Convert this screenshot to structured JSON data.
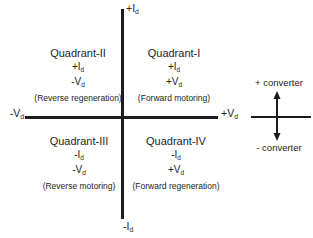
{
  "diagram": {
    "axes": {
      "top_label": {
        "main": "+I",
        "sub": "d"
      },
      "bottom_label": {
        "main": "-I",
        "sub": "d"
      },
      "left_label": {
        "main": "-V",
        "sub": "d"
      },
      "right_label": {
        "main": "+V",
        "sub": "d"
      }
    },
    "quadrants": {
      "q1": {
        "title": "Quadrant-I",
        "current": {
          "main": "+I",
          "sub": "d"
        },
        "voltage": {
          "main": "+V",
          "sub": "d"
        },
        "caption": "(Forward motoring)"
      },
      "q2": {
        "title": "Quadrant-II",
        "current": {
          "main": "+I",
          "sub": "d"
        },
        "voltage": {
          "main": "-V",
          "sub": "d"
        },
        "caption": "(Reverse regeneration)"
      },
      "q3": {
        "title": "Quadrant-III",
        "current": {
          "main": "-I",
          "sub": "d"
        },
        "voltage": {
          "main": "-V",
          "sub": "d"
        },
        "caption": "(Reverse motoring)"
      },
      "q4": {
        "title": "Quadrant-IV",
        "current": {
          "main": "-I",
          "sub": "d"
        },
        "voltage": {
          "main": "+V",
          "sub": "d"
        },
        "caption": "(Forward regeneration)"
      }
    },
    "converter": {
      "positive_label": "+ converter",
      "negative_label": "- converter"
    },
    "colors": {
      "line": "#1c1c1c",
      "text": "#242424",
      "background": "#ffffff"
    }
  }
}
